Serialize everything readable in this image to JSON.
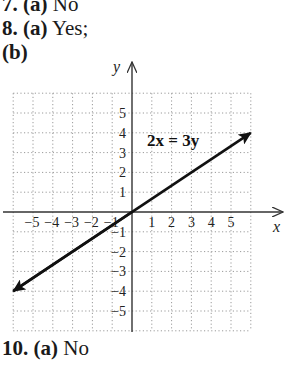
{
  "answers": {
    "q7": {
      "number": "7.",
      "part": "(a)",
      "answer": "No"
    },
    "q8": {
      "number": "8.",
      "part": "(a)",
      "answer": "Yes;",
      "subpart": "(b)"
    },
    "q10": {
      "number": "10.",
      "part": "(a)",
      "answer": "No"
    }
  },
  "colors": {
    "grid": "#9a9a9a",
    "axis": "#333333",
    "line": "#111111"
  },
  "chart_data": {
    "type": "line",
    "title": "",
    "equation_label": "2x = 3y",
    "xlabel": "x",
    "ylabel": "y",
    "xlim": [
      -6,
      6
    ],
    "ylim": [
      -6,
      6
    ],
    "grid": true,
    "grid_style": "dotted",
    "x_ticks": [
      -5,
      -4,
      -3,
      -2,
      -1,
      1,
      2,
      3,
      4,
      5
    ],
    "y_ticks": [
      5,
      4,
      3,
      2,
      1,
      -1,
      -2,
      -3,
      -4,
      -5
    ],
    "x_tick_labels": [
      "−5",
      "−4",
      "−3",
      "−2",
      "−1",
      "1",
      "2",
      "3",
      "4",
      "5"
    ],
    "y_tick_labels": [
      "5",
      "4",
      "3",
      "2",
      "1",
      "−1",
      "−2",
      "−3",
      "−4",
      "−5"
    ],
    "series": [
      {
        "name": "2x = 3y",
        "x": [
          -6,
          6
        ],
        "y": [
          -4,
          4
        ],
        "arrows": "both"
      }
    ]
  }
}
